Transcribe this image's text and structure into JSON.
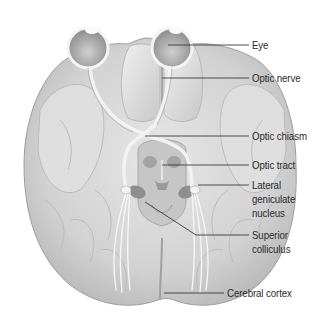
{
  "diagram": {
    "line_color": "#3a3a3a",
    "labels": [
      {
        "id": "eye",
        "lines": [
          "Eye"
        ]
      },
      {
        "id": "optic_nerve",
        "lines": [
          "Optic nerve"
        ]
      },
      {
        "id": "optic_chiasm",
        "lines": [
          "Optic chiasm"
        ]
      },
      {
        "id": "optic_tract",
        "lines": [
          "Optic tract"
        ]
      },
      {
        "id": "lgn",
        "lines": [
          "Lateral",
          "geniculate",
          "nucleus"
        ]
      },
      {
        "id": "superior_colliculus",
        "lines": [
          "Superior",
          "colliculus"
        ]
      },
      {
        "id": "cerebral_cortex",
        "lines": [
          "Cerebral cortex"
        ]
      }
    ]
  }
}
